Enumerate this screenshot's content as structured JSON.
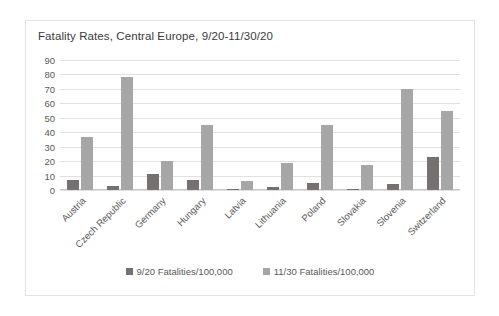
{
  "chart_data": {
    "type": "bar",
    "title": "Fatality Rates, Central Europe, 9/20-11/30/20",
    "xlabel": "",
    "ylabel": "",
    "ylim": [
      0,
      90
    ],
    "yticks": [
      90,
      80,
      70,
      60,
      50,
      40,
      30,
      20,
      10,
      0
    ],
    "grid": true,
    "legend_position": "bottom",
    "categories": [
      "Austria",
      "Czech Republic",
      "Germany",
      "Hungary",
      "Latvia",
      "Lithuania",
      "Poland",
      "Slovakia",
      "Slovenia",
      "Switzerland"
    ],
    "series": [
      {
        "name": "9/20 Fatalities/100,000",
        "color": "#767171",
        "values": [
          7,
          3,
          11,
          7,
          1,
          2,
          5,
          0.5,
          4,
          23
        ]
      },
      {
        "name": "11/30 Fatalities/100,000",
        "color": "#a6a6a6",
        "values": [
          37,
          78,
          20,
          45,
          6,
          19,
          45,
          17,
          70,
          55
        ]
      }
    ]
  }
}
